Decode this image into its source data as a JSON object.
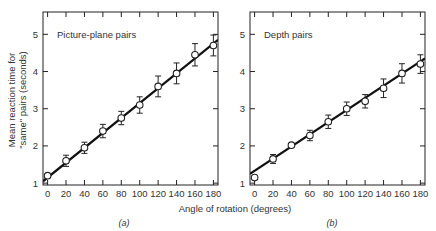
{
  "figure": {
    "ylabel_line1": "Mean reaction time for",
    "ylabel_line2": "\"same\" pairs (seconds)",
    "xlabel": "Angle of rotation (degrees)"
  },
  "chart_data": [
    {
      "type": "scatter",
      "panel_label": "(a)",
      "title": "Picture-plane pairs",
      "xlabel": "Angle of rotation (degrees)",
      "ylabel": "Mean reaction time for \"same\" pairs (seconds)",
      "x": [
        0,
        20,
        40,
        60,
        80,
        100,
        120,
        140,
        160,
        180
      ],
      "values": [
        1.2,
        1.6,
        1.95,
        2.4,
        2.75,
        3.1,
        3.6,
        3.95,
        4.45,
        4.7
      ],
      "error": [
        0.05,
        0.15,
        0.15,
        0.18,
        0.18,
        0.22,
        0.28,
        0.28,
        0.3,
        0.28
      ],
      "fit_line": {
        "x": [
          -5,
          185
        ],
        "y": [
          1.05,
          4.85
        ]
      },
      "xticks": [
        0,
        20,
        40,
        60,
        80,
        100,
        120,
        140,
        160,
        180
      ],
      "yticks": [
        1,
        2,
        3,
        4,
        5
      ],
      "xlim": [
        -5,
        185
      ],
      "ylim": [
        0.95,
        5.6
      ],
      "grid": false
    },
    {
      "type": "scatter",
      "panel_label": "(b)",
      "title": "Depth pairs",
      "xlabel": "Angle of rotation (degrees)",
      "ylabel": "Mean reaction time for \"same\" pairs (seconds)",
      "x": [
        0,
        20,
        40,
        60,
        80,
        100,
        120,
        140,
        160,
        180
      ],
      "values": [
        1.15,
        1.65,
        2.02,
        2.28,
        2.65,
        3.0,
        3.2,
        3.55,
        3.95,
        4.2
      ],
      "error": [
        0.05,
        0.12,
        0.05,
        0.14,
        0.18,
        0.18,
        0.18,
        0.25,
        0.26,
        0.25
      ],
      "fit_line": {
        "x": [
          -5,
          185
        ],
        "y": [
          1.25,
          4.35
        ]
      },
      "xticks": [
        0,
        20,
        40,
        60,
        80,
        100,
        120,
        140,
        160,
        180
      ],
      "yticks": [
        1,
        2,
        3,
        4,
        5
      ],
      "xlim": [
        -5,
        185
      ],
      "ylim": [
        0.95,
        5.6
      ],
      "grid": false
    }
  ]
}
